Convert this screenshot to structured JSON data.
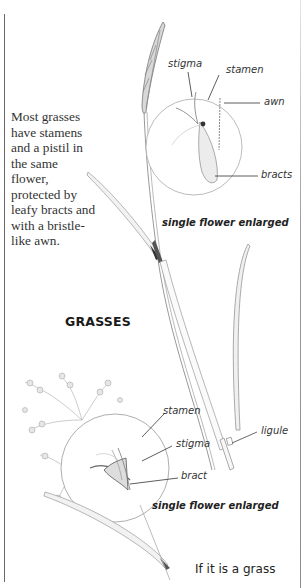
{
  "body_text": {
    "lines": [
      "Most grasses",
      "have stamens",
      "and a pistil in",
      "the same",
      "flower,",
      "protected by",
      "leafy bracts and",
      "with a bristle-",
      "like awn."
    ]
  },
  "heading": "GRASSES",
  "top_diagram": {
    "labels": {
      "stigma": "stigma",
      "stamen": "stamen",
      "awn": "awn",
      "bracts": "bracts"
    },
    "caption": "single flower enlarged"
  },
  "bottom_diagram": {
    "labels": {
      "stamen": "stamen",
      "stigma": "stigma",
      "bract": "bract",
      "ligule": "ligule"
    },
    "caption": "single flower enlarged"
  },
  "footer_text": "If it is a grass",
  "colors": {
    "text": "#333333",
    "line": "#6a6a6a",
    "background": "#ffffff"
  }
}
